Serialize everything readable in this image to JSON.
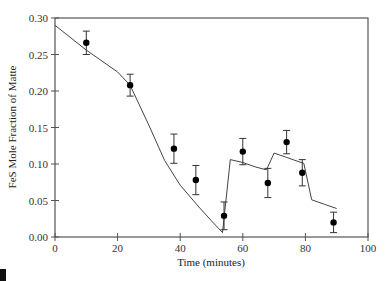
{
  "chart_data": {
    "type": "scatter",
    "title": "",
    "xlabel": "Time (minutes)",
    "ylabel": "FeS Mole Fraction of Matte",
    "xlim": [
      0,
      100
    ],
    "ylim": [
      0.0,
      0.3
    ],
    "xticks": [
      0,
      20,
      40,
      60,
      80,
      100
    ],
    "yticks": [
      0.0,
      0.05,
      0.1,
      0.15,
      0.2,
      0.25,
      0.3
    ],
    "xtick_labels": [
      "0",
      "20",
      "40",
      "60",
      "80",
      "100"
    ],
    "ytick_labels": [
      "0.00",
      "0.05",
      "0.10",
      "0.15",
      "0.20",
      "0.25",
      "0.30"
    ],
    "grid": false,
    "legend": null,
    "series": [
      {
        "name": "Measured",
        "kind": "scatter_errorbar",
        "x": [
          10,
          24,
          38,
          45,
          54,
          60,
          68,
          74,
          79,
          89
        ],
        "y": [
          0.266,
          0.208,
          0.121,
          0.078,
          0.029,
          0.117,
          0.074,
          0.13,
          0.088,
          0.02
        ],
        "yerr": [
          0.016,
          0.015,
          0.02,
          0.02,
          0.019,
          0.018,
          0.02,
          0.016,
          0.018,
          0.014
        ]
      },
      {
        "name": "Model",
        "kind": "line",
        "x": [
          0,
          10,
          20,
          24,
          30,
          35,
          40,
          46,
          50,
          53.5,
          56,
          60,
          64,
          67.5,
          68,
          70,
          74,
          78,
          79.5,
          82,
          86,
          90
        ],
        "y": [
          0.29,
          0.256,
          0.226,
          0.208,
          0.153,
          0.105,
          0.071,
          0.041,
          0.022,
          0.006,
          0.106,
          0.102,
          0.096,
          0.092,
          0.096,
          0.115,
          0.109,
          0.103,
          0.101,
          0.051,
          0.045,
          0.039
        ]
      }
    ]
  }
}
